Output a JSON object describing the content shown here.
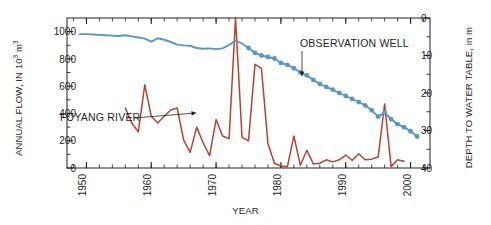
{
  "figure": {
    "background": "#ffffff",
    "plot_area": {
      "left": 67,
      "top": 18,
      "right": 430,
      "bottom": 168
    }
  },
  "labels": {
    "ylabel_left_pre": "ANNUAL FLOW, IN 10",
    "ylabel_left_sup": "3",
    "ylabel_left_post": " m",
    "ylabel_left_sup2": "3",
    "ylabel_right": "DEPTH TO WATER TABLE, in m",
    "xlabel": "YEAR",
    "annotation_river": "FUYANG RIVER",
    "annotation_well": "OBSERVATION WELL"
  },
  "colors": {
    "river": "#b5432c",
    "well": "#5b96c4",
    "axis": "#231f20",
    "text": "#231f20"
  },
  "chart_data": {
    "type": "line",
    "title": "",
    "xlabel": "YEAR",
    "xlim": [
      1947,
      2003
    ],
    "xticks_major": [
      1950,
      1960,
      1970,
      1980,
      1990,
      2000
    ],
    "xticks_minor_step": 2,
    "grid": false,
    "legend_position": "inline-annotations",
    "axes": [
      {
        "id": "left",
        "label": "ANNUAL FLOW, IN 10^3 m^3",
        "ylim": [
          0,
          1100
        ],
        "yticks": [
          0,
          200,
          400,
          600,
          800,
          1000
        ],
        "ytick_labels": [
          "0",
          "200",
          "400",
          "600",
          "800",
          "1000"
        ],
        "direction": "normal"
      },
      {
        "id": "right",
        "label": "DEPTH TO WATER TABLE, in m",
        "ylim": [
          0,
          40
        ],
        "yticks": [
          0,
          10,
          20,
          30,
          40
        ],
        "ytick_labels": [
          "0",
          "10",
          "20",
          "30",
          "40"
        ],
        "direction": "inverted"
      }
    ],
    "series": [
      {
        "name": "FUYANG RIVER",
        "axis": "left",
        "color": "#b5432c",
        "style": "line",
        "markers": false,
        "units": "10^3 m^3",
        "x": [
          1956,
          1957,
          1958,
          1959,
          1960,
          1961,
          1962,
          1963,
          1964,
          1965,
          1966,
          1967,
          1968,
          1969,
          1970,
          1971,
          1972,
          1973,
          1974,
          1975,
          1976,
          1977,
          1978,
          1979,
          1980,
          1981,
          1982,
          1983,
          1984,
          1985,
          1986,
          1987,
          1988,
          1989,
          1990,
          1991,
          1992,
          1993,
          1994,
          1995,
          1996,
          1997,
          1998,
          1999
        ],
        "values": [
          440,
          330,
          265,
          610,
          380,
          330,
          380,
          425,
          440,
          205,
          115,
          300,
          185,
          90,
          355,
          235,
          215,
          1100,
          225,
          200,
          760,
          730,
          180,
          35,
          15,
          10,
          235,
          20,
          130,
          30,
          35,
          60,
          45,
          60,
          95,
          55,
          105,
          60,
          65,
          80,
          470,
          10,
          60,
          50
        ]
      },
      {
        "name": "OBSERVATION WELL",
        "axis": "right",
        "color": "#5b96c4",
        "style": "line-with-dots",
        "markers": true,
        "markers_start_year": 1975,
        "units": "m",
        "x": [
          1949,
          1950,
          1951,
          1952,
          1953,
          1954,
          1955,
          1956,
          1957,
          1958,
          1959,
          1960,
          1961,
          1962,
          1963,
          1964,
          1965,
          1966,
          1967,
          1968,
          1969,
          1970,
          1971,
          1972,
          1973,
          1974,
          1975,
          1976,
          1977,
          1978,
          1979,
          1980,
          1981,
          1982,
          1983,
          1984,
          1985,
          1986,
          1987,
          1988,
          1989,
          1990,
          1991,
          1992,
          1993,
          1994,
          1995,
          1996,
          1997,
          1998,
          1999,
          2000,
          2001
        ],
        "values": [
          4.3,
          4.3,
          4.4,
          4.5,
          4.6,
          4.7,
          4.8,
          4.6,
          4.9,
          5.2,
          5.5,
          6.3,
          5.4,
          5.8,
          6.4,
          7.1,
          7.3,
          7.4,
          8.0,
          8.2,
          8.1,
          8.3,
          8.1,
          7.2,
          6.0,
          6.8,
          8.0,
          9.3,
          10.0,
          10.4,
          10.8,
          12.0,
          12.5,
          13.4,
          14.5,
          15.3,
          16.5,
          17.6,
          18.4,
          19.1,
          20.0,
          20.8,
          21.6,
          22.4,
          23.3,
          24.6,
          26.3,
          25.2,
          27.0,
          28.3,
          29.1,
          30.2,
          31.6
        ]
      }
    ],
    "annotations": [
      {
        "text": "FUYANG RIVER",
        "x_px": 60,
        "y_px": 121,
        "arrow_to_px": [
          196,
          113
        ]
      },
      {
        "text": "OBSERVATION WELL",
        "x_px": 300,
        "y_px": 47,
        "arrow_to_px": [
          302,
          76
        ]
      }
    ]
  }
}
